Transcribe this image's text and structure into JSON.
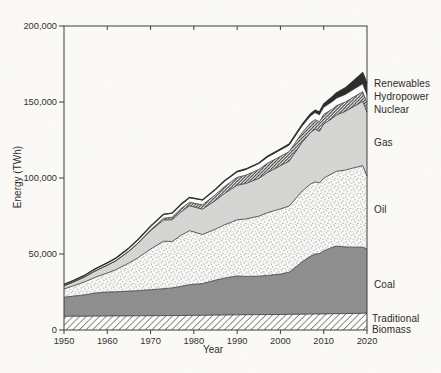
{
  "figure": {
    "paper_color": "#fbfaf7",
    "band_white": "#fdfdfb",
    "axis_color": "#3c3c3c",
    "text_color": "#303030"
  },
  "chart_data": {
    "type": "area",
    "stacked": true,
    "title": "",
    "xlabel": "Year",
    "ylabel": "Energy (TWh)",
    "xlim": [
      1950,
      2020
    ],
    "ylim": [
      0,
      200000
    ],
    "x_ticks": [
      1950,
      1960,
      1970,
      1980,
      1990,
      2000,
      2010,
      2020
    ],
    "x_tick_labels": [
      "1950",
      "1960",
      "1970",
      "1980",
      "1990",
      "2000",
      "2010",
      "2020"
    ],
    "y_ticks": [
      0,
      50000,
      100000,
      150000,
      200000
    ],
    "y_tick_labels": [
      "0",
      "50,000",
      "100,000",
      "150,000",
      "200,000"
    ],
    "grid": false,
    "legend_position": "right-annotations",
    "outline_color": "#2e2e2e",
    "x": [
      1950,
      1952,
      1955,
      1957,
      1960,
      1962,
      1965,
      1967,
      1970,
      1973,
      1975,
      1977,
      1979,
      1982,
      1985,
      1987,
      1990,
      1992,
      1995,
      1997,
      2000,
      2002,
      2005,
      2007,
      2008,
      2009,
      2010,
      2012,
      2013,
      2015,
      2017,
      2019,
      2020
    ],
    "series": [
      {
        "name": "Traditional Biomass",
        "texture": "diagonal-hatch-wide",
        "fill": "#fdfdfb",
        "pattern_color": "#4a4a4a",
        "values": [
          9000,
          9050,
          9100,
          9150,
          9200,
          9250,
          9300,
          9350,
          9400,
          9450,
          9500,
          9550,
          9600,
          9700,
          9800,
          9900,
          10000,
          10050,
          10100,
          10150,
          10200,
          10300,
          10400,
          10450,
          10500,
          10500,
          10550,
          10700,
          10700,
          10800,
          10900,
          11000,
          11100
        ]
      },
      {
        "name": "Coal",
        "texture": "solid",
        "fill": "#8e8e8e",
        "values": [
          12600,
          13200,
          14100,
          15100,
          15800,
          15900,
          16300,
          16500,
          17100,
          17700,
          18200,
          19200,
          20200,
          20800,
          23000,
          24200,
          25500,
          25200,
          25300,
          25800,
          26600,
          27700,
          34500,
          38200,
          39500,
          39800,
          41500,
          43800,
          44500,
          43900,
          43600,
          43500,
          42200
        ]
      },
      {
        "name": "Oil",
        "texture": "stipple-dots",
        "fill": "#fdfdfb",
        "pattern_color": "#6e6e6e",
        "values": [
          5400,
          6600,
          8700,
          10200,
          12500,
          14500,
          18500,
          21500,
          26700,
          31300,
          30500,
          33500,
          35500,
          32300,
          33500,
          35000,
          37000,
          37800,
          39500,
          41200,
          42900,
          43500,
          46500,
          47400,
          47500,
          46400,
          47800,
          48500,
          49200,
          50500,
          52200,
          53600,
          48000
        ]
      },
      {
        "name": "Gas",
        "texture": "solid",
        "fill": "#d5d5d3",
        "values": [
          2100,
          2500,
          3300,
          4100,
          5100,
          5900,
          7700,
          9400,
          12100,
          13900,
          14300,
          15400,
          16400,
          16700,
          18900,
          20600,
          22700,
          23300,
          24800,
          26400,
          28300,
          29500,
          32000,
          34000,
          34600,
          34000,
          35700,
          36300,
          37100,
          38600,
          40400,
          42300,
          41900
        ]
      },
      {
        "name": "Nuclear",
        "texture": "diagonal-hatch-dense",
        "fill": "#fdfdfb",
        "pattern_color": "#2e2e2e",
        "values": [
          0,
          0,
          0,
          0,
          0,
          30,
          100,
          250,
          600,
          1200,
          1700,
          2100,
          2400,
          2900,
          3900,
          4600,
          5200,
          5500,
          5900,
          6100,
          6200,
          6300,
          6400,
          6350,
          6300,
          6200,
          6300,
          6100,
          6100,
          6200,
          6300,
          6400,
          6200
        ]
      },
      {
        "name": "Hydropower",
        "texture": "solid",
        "fill": "#fdfdfb",
        "values": [
          900,
          1000,
          1100,
          1300,
          1600,
          1750,
          2000,
          2200,
          2400,
          2600,
          2700,
          2850,
          3000,
          3100,
          3300,
          3450,
          3600,
          3700,
          3900,
          4050,
          4200,
          4300,
          4400,
          4500,
          4600,
          4700,
          4750,
          4900,
          4950,
          5000,
          5100,
          5200,
          5300
        ]
      },
      {
        "name": "Renewables",
        "texture": "solid",
        "fill": "#2c2c2c",
        "values": [
          0,
          0,
          0,
          0,
          0,
          0,
          0,
          0,
          0,
          0,
          0,
          20,
          50,
          100,
          200,
          250,
          300,
          350,
          400,
          500,
          600,
          700,
          1000,
          1400,
          1600,
          1800,
          2100,
          3100,
          3500,
          4300,
          5700,
          7200,
          7600
        ]
      }
    ]
  }
}
